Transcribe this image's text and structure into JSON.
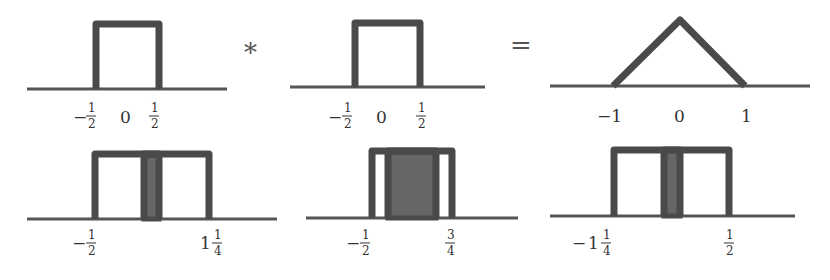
{
  "diagram": {
    "operators": {
      "convolve": "*",
      "equals": "="
    },
    "row1": {
      "panels": [
        {
          "id": "box-1",
          "shape": "rect",
          "support": [
            -0.5,
            0.5
          ],
          "labels": [
            {
              "sign": "−",
              "num": "1",
              "den": "2",
              "value": -0.5
            },
            {
              "text": "0",
              "value": 0
            },
            {
              "sign": "",
              "num": "1",
              "den": "2",
              "value": 0.5
            }
          ]
        },
        {
          "id": "box-2",
          "shape": "rect",
          "support": [
            -0.5,
            0.5
          ],
          "labels": [
            {
              "sign": "−",
              "num": "1",
              "den": "2",
              "value": -0.5
            },
            {
              "text": "0",
              "value": 0
            },
            {
              "sign": "",
              "num": "1",
              "den": "2",
              "value": 0.5
            }
          ]
        },
        {
          "id": "triangle-result",
          "shape": "triangle",
          "support": [
            -1,
            1
          ],
          "labels": [
            {
              "text": "−1",
              "value": -1
            },
            {
              "text": "0",
              "value": 0
            },
            {
              "text": "1",
              "value": 1
            }
          ]
        }
      ]
    },
    "row2": {
      "panels": [
        {
          "id": "shift-1",
          "shift": 0.75,
          "overlap": "small",
          "labels": [
            {
              "sign": "−",
              "whole": "",
              "num": "1",
              "den": "2",
              "value": -0.5
            },
            {
              "sign": "",
              "whole": "1",
              "num": "1",
              "den": "4",
              "value": 1.25
            }
          ]
        },
        {
          "id": "shift-2",
          "shift": 0.25,
          "overlap": "large",
          "labels": [
            {
              "sign": "−",
              "whole": "",
              "num": "1",
              "den": "2",
              "value": -0.5
            },
            {
              "sign": "",
              "whole": "",
              "num": "3",
              "den": "4",
              "value": 0.75
            }
          ]
        },
        {
          "id": "shift-3",
          "shift": -0.75,
          "overlap": "small",
          "labels": [
            {
              "sign": "−",
              "whole": "1",
              "num": "1",
              "den": "4",
              "value": -1.25
            },
            {
              "sign": "",
              "whole": "",
              "num": "1",
              "den": "2",
              "value": 0.5
            }
          ]
        }
      ]
    }
  }
}
